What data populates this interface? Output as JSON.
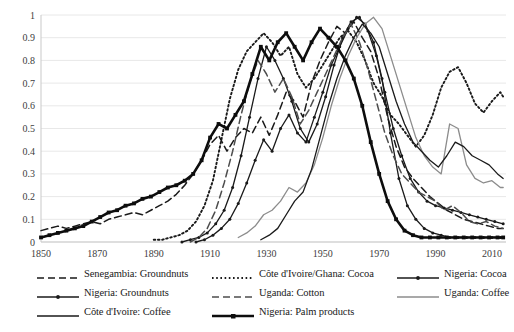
{
  "chart_data": {
    "type": "line",
    "title": "",
    "xlabel": "",
    "ylabel": "",
    "xlim": [
      1850,
      2015
    ],
    "ylim": [
      0,
      1
    ],
    "grid": true,
    "grid_color": "#e8e8e8",
    "legend_position": "bottom",
    "x_ticks": [
      "1850",
      "1870",
      "1890",
      "1910",
      "1930",
      "1950",
      "1970",
      "1990",
      "2010"
    ],
    "x_tick_values": [
      1850,
      1870,
      1890,
      1910,
      1930,
      1950,
      1970,
      1990,
      2010
    ],
    "y_ticks": [
      "0",
      "0.1",
      "0.2",
      "0.3",
      "0.4",
      "0.5",
      "0.6",
      "0.7",
      "0.8",
      "0.9",
      "1"
    ],
    "y_tick_values": [
      0,
      0.1,
      0.2,
      0.3,
      0.4,
      0.5,
      0.6,
      0.7,
      0.8,
      0.9,
      1
    ],
    "series": [
      {
        "name": "Senegambia: Groundnuts",
        "style": "dashed",
        "color": "#1a1a1a",
        "marker": "none",
        "x": [
          1850,
          1853,
          1856,
          1859,
          1862,
          1865,
          1868,
          1871,
          1874,
          1877,
          1880,
          1883,
          1886,
          1889,
          1892,
          1895,
          1898,
          1901,
          1904,
          1907,
          1910,
          1913,
          1916,
          1919,
          1922,
          1925,
          1928,
          1931,
          1934,
          1937,
          1940,
          1943,
          1946,
          1949,
          1952,
          1955,
          1958,
          1961,
          1964,
          1967,
          1970,
          1973,
          1976,
          1979,
          1982,
          1985,
          1988,
          1991,
          1994,
          1997,
          2000,
          2003,
          2006,
          2009,
          2012,
          2014
        ],
        "y": [
          0.05,
          0.06,
          0.07,
          0.06,
          0.07,
          0.08,
          0.09,
          0.08,
          0.1,
          0.11,
          0.12,
          0.13,
          0.12,
          0.14,
          0.16,
          0.18,
          0.21,
          0.25,
          0.3,
          0.36,
          0.43,
          0.47,
          0.4,
          0.46,
          0.5,
          0.48,
          0.55,
          0.47,
          0.56,
          0.66,
          0.62,
          0.55,
          0.7,
          0.8,
          0.88,
          0.95,
          0.92,
          0.97,
          0.9,
          0.84,
          0.72,
          0.55,
          0.42,
          0.33,
          0.28,
          0.24,
          0.2,
          0.17,
          0.14,
          0.12,
          0.1,
          0.09,
          0.08,
          0.07,
          0.06,
          0.06
        ]
      },
      {
        "name": "Côte d'Ivoire/Ghana: Cocoa",
        "style": "dotted",
        "color": "#1a1a1a",
        "marker": "none",
        "x": [
          1890,
          1893,
          1896,
          1899,
          1902,
          1905,
          1908,
          1911,
          1914,
          1917,
          1920,
          1923,
          1926,
          1929,
          1932,
          1935,
          1938,
          1941,
          1944,
          1947,
          1950,
          1953,
          1956,
          1959,
          1962,
          1965,
          1968,
          1971,
          1974,
          1977,
          1980,
          1983,
          1986,
          1989,
          1992,
          1995,
          1998,
          2001,
          2004,
          2007,
          2010,
          2013,
          2014
        ],
        "y": [
          0.01,
          0.01,
          0.02,
          0.03,
          0.05,
          0.09,
          0.16,
          0.27,
          0.45,
          0.63,
          0.76,
          0.84,
          0.88,
          0.92,
          0.88,
          0.82,
          0.86,
          0.74,
          0.68,
          0.72,
          0.78,
          0.84,
          0.9,
          0.93,
          0.88,
          0.8,
          0.7,
          0.64,
          0.56,
          0.52,
          0.47,
          0.42,
          0.47,
          0.56,
          0.68,
          0.75,
          0.77,
          0.7,
          0.61,
          0.57,
          0.62,
          0.66,
          0.64
        ]
      },
      {
        "name": "Nigeria: Cocoa",
        "style": "solid",
        "color": "#1a1a1a",
        "marker": "dot",
        "x": [
          1900,
          1903,
          1906,
          1909,
          1912,
          1915,
          1918,
          1921,
          1924,
          1927,
          1930,
          1933,
          1936,
          1939,
          1942,
          1945,
          1948,
          1951,
          1954,
          1957,
          1960,
          1963,
          1966,
          1969,
          1972,
          1975,
          1978,
          1981,
          1984,
          1987,
          1990,
          1993,
          1996,
          1999,
          2002,
          2005,
          2008,
          2011,
          2014
        ],
        "y": [
          0.0,
          0.01,
          0.02,
          0.04,
          0.08,
          0.14,
          0.24,
          0.38,
          0.55,
          0.72,
          0.86,
          0.8,
          0.72,
          0.62,
          0.5,
          0.44,
          0.52,
          0.64,
          0.78,
          0.9,
          0.97,
          0.99,
          0.93,
          0.82,
          0.66,
          0.5,
          0.38,
          0.28,
          0.22,
          0.18,
          0.16,
          0.15,
          0.14,
          0.13,
          0.12,
          0.11,
          0.1,
          0.09,
          0.08
        ]
      },
      {
        "name": "Nigeria: Groundnuts",
        "style": "solid",
        "color": "#1a1a1a",
        "marker": "dot",
        "x": [
          1905,
          1908,
          1911,
          1914,
          1917,
          1920,
          1923,
          1926,
          1929,
          1932,
          1935,
          1938,
          1941,
          1944,
          1947,
          1950,
          1953,
          1956,
          1959,
          1962,
          1965,
          1968,
          1971,
          1974,
          1977,
          1980,
          1983,
          1986,
          1989,
          1992,
          1995,
          1998,
          2001,
          2004,
          2007,
          2010,
          2013,
          2014
        ],
        "y": [
          0.0,
          0.01,
          0.03,
          0.06,
          0.1,
          0.17,
          0.26,
          0.36,
          0.45,
          0.4,
          0.5,
          0.56,
          0.48,
          0.44,
          0.55,
          0.66,
          0.78,
          0.86,
          0.94,
          0.99,
          0.96,
          0.88,
          0.72,
          0.48,
          0.28,
          0.16,
          0.1,
          0.06,
          0.04,
          0.03,
          0.02,
          0.02,
          0.02,
          0.02,
          0.02,
          0.02,
          0.02,
          0.02
        ]
      },
      {
        "name": "Uganda: Cotton",
        "style": "dashed",
        "color": "#4d4d4d",
        "marker": "none",
        "x": [
          1903,
          1906,
          1909,
          1912,
          1915,
          1918,
          1921,
          1924,
          1927,
          1930,
          1933,
          1936,
          1939,
          1942,
          1945,
          1948,
          1951,
          1954,
          1957,
          1960,
          1963,
          1966,
          1969,
          1972,
          1975,
          1978,
          1981,
          1984,
          1987,
          1990,
          1993,
          1996,
          1999,
          2002,
          2005,
          2008,
          2011,
          2014
        ],
        "y": [
          0.0,
          0.02,
          0.06,
          0.14,
          0.26,
          0.4,
          0.56,
          0.7,
          0.8,
          0.74,
          0.66,
          0.72,
          0.64,
          0.52,
          0.58,
          0.66,
          0.74,
          0.82,
          0.9,
          0.96,
          0.88,
          0.76,
          0.62,
          0.48,
          0.38,
          0.3,
          0.26,
          0.22,
          0.2,
          0.18,
          0.14,
          0.16,
          0.13,
          0.09,
          0.08,
          0.09,
          0.07,
          0.06
        ]
      },
      {
        "name": "Uganda: Coffee",
        "style": "solid",
        "color": "#8c8c8c",
        "marker": "none",
        "x": [
          1920,
          1923,
          1926,
          1929,
          1932,
          1935,
          1938,
          1941,
          1944,
          1947,
          1950,
          1953,
          1956,
          1959,
          1962,
          1965,
          1968,
          1971,
          1974,
          1977,
          1980,
          1983,
          1986,
          1989,
          1992,
          1995,
          1998,
          2001,
          2004,
          2007,
          2010,
          2013,
          2014
        ],
        "y": [
          0.02,
          0.04,
          0.07,
          0.12,
          0.14,
          0.18,
          0.24,
          0.22,
          0.26,
          0.34,
          0.46,
          0.6,
          0.72,
          0.82,
          0.9,
          0.96,
          0.99,
          0.94,
          0.82,
          0.7,
          0.58,
          0.46,
          0.38,
          0.33,
          0.3,
          0.52,
          0.5,
          0.34,
          0.28,
          0.26,
          0.27,
          0.24,
          0.24
        ]
      },
      {
        "name": "Côte d'Ivoire: Coffee",
        "style": "solid",
        "color": "#1a1a1a",
        "marker": "none",
        "x": [
          1928,
          1931,
          1934,
          1937,
          1940,
          1943,
          1946,
          1949,
          1952,
          1955,
          1958,
          1961,
          1964,
          1967,
          1970,
          1973,
          1976,
          1979,
          1982,
          1985,
          1988,
          1991,
          1994,
          1997,
          2000,
          2003,
          2006,
          2009,
          2012,
          2014
        ],
        "y": [
          0.01,
          0.03,
          0.06,
          0.12,
          0.18,
          0.22,
          0.32,
          0.46,
          0.6,
          0.72,
          0.82,
          0.9,
          0.96,
          0.92,
          0.86,
          0.74,
          0.62,
          0.52,
          0.44,
          0.4,
          0.36,
          0.33,
          0.38,
          0.44,
          0.42,
          0.38,
          0.36,
          0.34,
          0.3,
          0.28
        ]
      },
      {
        "name": "Nigeria: Palm products",
        "style": "solid-bold",
        "color": "#0d0d0d",
        "marker": "square",
        "x": [
          1850,
          1853,
          1856,
          1859,
          1862,
          1865,
          1868,
          1871,
          1874,
          1877,
          1880,
          1883,
          1886,
          1889,
          1892,
          1895,
          1898,
          1901,
          1904,
          1907,
          1910,
          1913,
          1916,
          1919,
          1922,
          1925,
          1928,
          1931,
          1934,
          1937,
          1940,
          1943,
          1946,
          1949,
          1952,
          1955,
          1958,
          1961,
          1964,
          1967,
          1970,
          1973,
          1976,
          1979,
          1982,
          1985,
          1988,
          1991,
          1994,
          1997,
          2000,
          2003,
          2006,
          2009,
          2012,
          2014
        ],
        "y": [
          0.02,
          0.03,
          0.04,
          0.05,
          0.06,
          0.07,
          0.09,
          0.11,
          0.13,
          0.14,
          0.16,
          0.17,
          0.19,
          0.2,
          0.22,
          0.24,
          0.25,
          0.27,
          0.3,
          0.36,
          0.46,
          0.52,
          0.5,
          0.56,
          0.62,
          0.74,
          0.86,
          0.8,
          0.88,
          0.92,
          0.86,
          0.8,
          0.88,
          0.94,
          0.9,
          0.86,
          0.8,
          0.72,
          0.6,
          0.44,
          0.3,
          0.18,
          0.1,
          0.05,
          0.03,
          0.02,
          0.02,
          0.02,
          0.02,
          0.02,
          0.02,
          0.02,
          0.02,
          0.02,
          0.02,
          0.02
        ]
      }
    ]
  },
  "legend": {
    "rows": [
      [
        {
          "label": "Senegambia: Groundnuts",
          "style": "dashed",
          "color": "#1a1a1a",
          "marker": "none"
        },
        {
          "label": "Côte d'Ivoire/Ghana: Cocoa",
          "style": "dotted",
          "color": "#1a1a1a",
          "marker": "none"
        },
        {
          "label": "Nigeria: Cocoa",
          "style": "solid",
          "color": "#1a1a1a",
          "marker": "dot"
        }
      ],
      [
        {
          "label": "Nigeria: Groundnuts",
          "style": "solid",
          "color": "#1a1a1a",
          "marker": "dot"
        },
        {
          "label": "Uganda: Cotton",
          "style": "dashed",
          "color": "#4d4d4d",
          "marker": "none"
        },
        {
          "label": "Uganda: Coffee",
          "style": "solid",
          "color": "#8c8c8c",
          "marker": "none"
        }
      ],
      [
        {
          "label": "Côte d'Ivoire: Coffee",
          "style": "solid",
          "color": "#1a1a1a",
          "marker": "none"
        },
        {
          "label": "Nigeria: Palm products",
          "style": "solid-bold",
          "color": "#0d0d0d",
          "marker": "square"
        }
      ]
    ]
  }
}
